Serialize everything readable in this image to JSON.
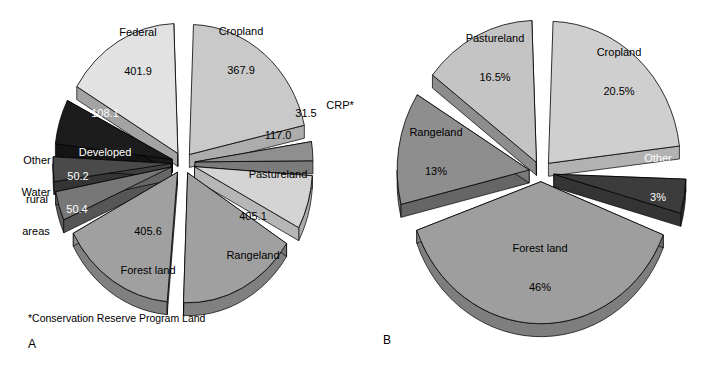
{
  "figure": {
    "background": "#ffffff",
    "width": 719,
    "height": 369,
    "footnote": "*Conservation Reserve Program Land",
    "caption_a": "A",
    "caption_b": "B"
  },
  "palette": {
    "very_light": "#e0e0e0",
    "light": "#c9c9c9",
    "medium_light": "#d4d4d4",
    "medium": "#a8a8a8",
    "medium_dark": "#8f8f8f",
    "dark": "#555555",
    "very_dark": "#2b2b2b",
    "outline": "#000000",
    "side_shade": "#bdbdbd"
  },
  "chart_data": [
    {
      "type": "pie",
      "id": "chart-a",
      "title": "",
      "caption": "A",
      "units": "million acres",
      "exploded": true,
      "three_d": true,
      "legend": "none",
      "footnote": "*Conservation Reserve Program Land",
      "total": 1564.2,
      "categories": [
        "Cropland",
        "CRP*",
        "Pastureland",
        "Rangeland",
        "Forest land",
        "Water areas",
        "Other rural",
        "Developed",
        "Federal"
      ],
      "values": [
        367.9,
        31.5,
        117.0,
        405.1,
        405.6,
        50.4,
        50.2,
        108.1,
        401.9
      ],
      "value_labels": [
        "367.9",
        "31.5",
        "117.0",
        "405.1",
        "405.6",
        "50.4",
        "50.2",
        "108.1",
        "401.9"
      ],
      "slices": [
        {
          "name": "Cropland",
          "value": 367.9,
          "value_label": "367.9",
          "label": "Cropland",
          "label_inside": true,
          "fill": "#c9c9c9",
          "text_color": "#000000"
        },
        {
          "name": "CRP*",
          "value": 31.5,
          "value_label": "31.5",
          "label": "CRP*",
          "label_inside": false,
          "fill": "#8f8f8f",
          "text_color": "#000000"
        },
        {
          "name": "Pastureland",
          "value": 117.0,
          "value_label": "117.0",
          "label": "Pastureland",
          "label_inside": true,
          "fill": "#d4d4d4",
          "text_color": "#000000"
        },
        {
          "name": "Rangeland",
          "value": 405.1,
          "value_label": "405.1",
          "label": "Rangeland",
          "label_inside": true,
          "fill": "#a0a0a0",
          "text_color": "#000000"
        },
        {
          "name": "Forest land",
          "value": 405.6,
          "value_label": "405.6",
          "label": "Forest land",
          "label_inside": true,
          "fill": "#a0a0a0",
          "text_color": "#000000"
        },
        {
          "name": "Water areas",
          "value": 50.4,
          "value_label": "50.4",
          "label": "Water areas",
          "label_inside": false,
          "fill": "#777777",
          "text_color": "#000000"
        },
        {
          "name": "Other rural",
          "value": 50.2,
          "value_label": "50.2",
          "label": "Other rural",
          "label_inside": false,
          "fill": "#4a4a4a",
          "text_color": "#000000"
        },
        {
          "name": "Developed",
          "value": 108.1,
          "value_label": "108.1",
          "label": "Developed",
          "label_inside": true,
          "fill": "#1c1c1c",
          "text_color": "#ffffff"
        },
        {
          "name": "Federal",
          "value": 401.9,
          "value_label": "401.9",
          "label": "Federal",
          "label_inside": true,
          "fill": "#e2e2e2",
          "text_color": "#000000"
        }
      ]
    },
    {
      "type": "pie",
      "id": "chart-b",
      "title": "",
      "caption": "B",
      "units": "percent",
      "exploded": true,
      "three_d": true,
      "legend": "none",
      "total": 99,
      "categories": [
        "Cropland",
        "Other",
        "Forest land",
        "Rangeland",
        "Pastureland"
      ],
      "values": [
        20.5,
        3,
        46,
        13,
        16.5
      ],
      "value_labels": [
        "20.5%",
        "3%",
        "46%",
        "13%",
        "16.5%"
      ],
      "slices": [
        {
          "name": "Cropland",
          "value": 20.5,
          "value_label": "20.5%",
          "label": "Cropland",
          "label_inside": true,
          "fill": "#cfcfcf",
          "text_color": "#000000"
        },
        {
          "name": "Other",
          "value": 3,
          "value_label": "3%",
          "label": "Other",
          "label_inside": true,
          "fill": "#3c3c3c",
          "text_color": "#ffffff"
        },
        {
          "name": "Forest land",
          "value": 46,
          "value_label": "46%",
          "label": "Forest land",
          "label_inside": true,
          "fill": "#9e9e9e",
          "text_color": "#000000"
        },
        {
          "name": "Rangeland",
          "value": 13,
          "value_label": "13%",
          "label": "Rangeland",
          "label_inside": true,
          "fill": "#8e8e8e",
          "text_color": "#000000"
        },
        {
          "name": "Pastureland",
          "value": 16.5,
          "value_label": "16.5%",
          "label": "Pastureland",
          "label_inside": true,
          "fill": "#c4c4c4",
          "text_color": "#000000"
        }
      ]
    }
  ],
  "chart_a_labels": {
    "federal": {
      "line1": "Federal",
      "line2": "401.9",
      "x": 138,
      "y": 52
    },
    "cropland": {
      "line1": "Cropland",
      "line2": "367.9",
      "x": 241,
      "y": 51
    },
    "crp": {
      "line1": "CRP*",
      "x": 340,
      "y": 105
    },
    "crp_value": {
      "line1": "31.5",
      "x": 306,
      "y": 113
    },
    "pastureland": {
      "line1": "117.0",
      "line2": "Pastureland",
      "x": 278,
      "y": 155
    },
    "rangeland": {
      "line1": "405.1",
      "line2": "Rangeland",
      "x": 253,
      "y": 236
    },
    "forest": {
      "line1": "405.6",
      "line2": "Forest land",
      "x": 148,
      "y": 251
    },
    "developed": {
      "line1": "108.1",
      "line2": "Developed",
      "x": 105,
      "y": 133
    },
    "otherrural_value": {
      "line1": "50.2",
      "x": 78,
      "y": 176
    },
    "otherrural": {
      "line1": "Other",
      "line2": "rural",
      "x": 37,
      "y": 180
    },
    "water_value": {
      "line1": "50.4",
      "x": 77,
      "y": 209
    },
    "water": {
      "line1": "Water",
      "line2": "areas",
      "x": 36,
      "y": 212
    }
  },
  "chart_b_labels": {
    "pastureland": {
      "line1": "Pastureland",
      "line2": "16.5%",
      "x": 495,
      "y": 58
    },
    "cropland": {
      "line1": "Cropland",
      "line2": "20.5%",
      "x": 619,
      "y": 72
    },
    "rangeland": {
      "line1": "Rangeland",
      "line2": "13%",
      "x": 436,
      "y": 152
    },
    "other": {
      "line1": "Other",
      "line2": "3%",
      "x": 658,
      "y": 178
    },
    "forest": {
      "line1": "Forest land",
      "line2": "46%",
      "x": 540,
      "y": 268
    }
  },
  "captions": {
    "a": {
      "text": "A",
      "x": 28,
      "y": 346
    },
    "b": {
      "text": "B",
      "x": 383,
      "y": 340
    },
    "footnote": {
      "text": "*Conservation Reserve Program Land",
      "x": 28,
      "y": 318
    }
  }
}
